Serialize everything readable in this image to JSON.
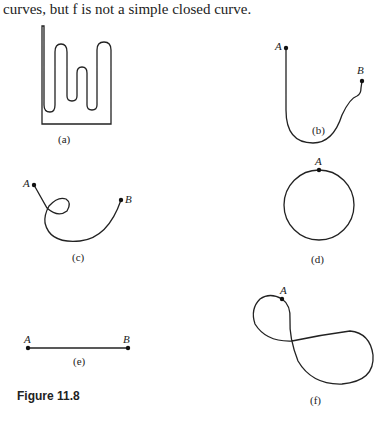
{
  "text": {
    "intro": "curves, but f is not a simple closed curve.",
    "figure_title": "Figure 11.8"
  },
  "panels": {
    "a": {
      "caption": "(a)"
    },
    "b": {
      "caption": "(b)",
      "label_start": "A",
      "label_end": "B"
    },
    "c": {
      "caption": "(c)",
      "label_start": "A",
      "label_end": "B"
    },
    "d": {
      "caption": "(d)",
      "label_point": "A"
    },
    "e": {
      "caption": "(e)",
      "label_start": "A",
      "label_end": "B"
    },
    "f": {
      "caption": "(f)",
      "label_point": "A"
    }
  }
}
